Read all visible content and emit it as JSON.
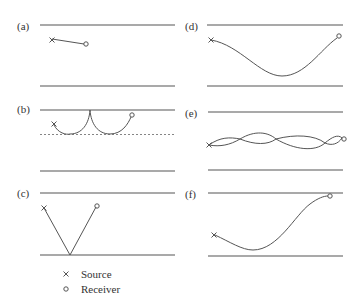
{
  "panels": [
    {
      "id": "a",
      "label": "(a)"
    },
    {
      "id": "b",
      "label": "(b)"
    },
    {
      "id": "c",
      "label": "(c)"
    },
    {
      "id": "d",
      "label": "(d)"
    },
    {
      "id": "e",
      "label": "(e)"
    },
    {
      "id": "f",
      "label": "(f)"
    }
  ],
  "legend": {
    "source_symbol": "×",
    "source_label": "Source",
    "receiver_symbol": "o",
    "receiver_label": "Receiver"
  }
}
